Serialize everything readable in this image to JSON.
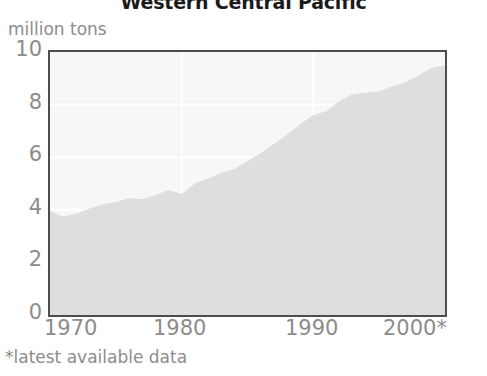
{
  "chart_data": {
    "type": "area",
    "title": "Western Central Pacific",
    "subtitle": "",
    "unit_label": "million tons",
    "xlabel": "",
    "ylabel": "million tons",
    "ylim": [
      0,
      10
    ],
    "xlim": [
      1970,
      2000
    ],
    "grid": true,
    "legend": null,
    "footnote": "*latest available data",
    "y_ticks": [
      "10",
      "8",
      "6",
      "4",
      "2",
      "0"
    ],
    "y_tick_values": [
      10,
      8,
      6,
      4,
      2,
      0
    ],
    "x_ticks": [
      "1970",
      "1980",
      "1990",
      "2000*"
    ],
    "x_tick_values": [
      1970,
      1980,
      1990,
      2000
    ],
    "series": [
      {
        "name": "Western Central Pacific catch",
        "fill_color": "#dedede",
        "x": [
          1970,
          1971,
          1972,
          1973,
          1974,
          1975,
          1976,
          1977,
          1978,
          1979,
          1980,
          1981,
          1982,
          1983,
          1984,
          1985,
          1986,
          1987,
          1988,
          1989,
          1990,
          1991,
          1992,
          1993,
          1994,
          1995,
          1996,
          1997,
          1998,
          1999,
          2000
        ],
        "values": [
          3.95,
          3.75,
          3.85,
          4.05,
          4.2,
          4.3,
          4.45,
          4.4,
          4.55,
          4.75,
          4.6,
          5.0,
          5.2,
          5.4,
          5.55,
          5.85,
          6.15,
          6.5,
          6.85,
          7.25,
          7.6,
          7.75,
          8.15,
          8.4,
          8.45,
          8.5,
          8.7,
          8.85,
          9.1,
          9.4,
          9.5
        ]
      }
    ]
  },
  "colors": {
    "area_fill": "#dedede",
    "plot_background": "#f7f7f7",
    "gridline": "#ffffff",
    "axis_frame": "#4d4d4d",
    "tick_text": "#8c8c8c",
    "title_text": "#1a1a1a"
  }
}
